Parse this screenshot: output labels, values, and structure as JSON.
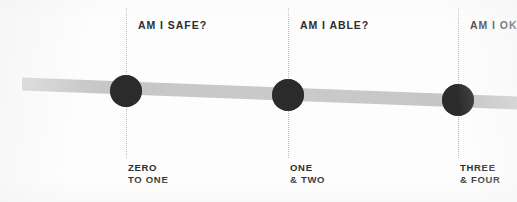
{
  "figure": {
    "type": "timeline-spectrum",
    "background_color": "#fdfdfd",
    "band_color": "#c9c9c9",
    "dot_color": "#2b2b2b",
    "guide_color": "#b9b9b9",
    "text_color": "#2d2d2d"
  },
  "markers": [
    {
      "question": "AM I SAFE?",
      "stage_line1": "ZERO",
      "stage_line2": "TO ONE",
      "x": 126,
      "y": 91,
      "radius": 16
    },
    {
      "question": "AM I ABLE?",
      "stage_line1": "ONE",
      "stage_line2": "& TWO",
      "x": 288,
      "y": 95,
      "radius": 16
    },
    {
      "question": "AM I OK",
      "stage_line1": "THREE",
      "stage_line2": "& FOUR",
      "x": 458,
      "y": 100,
      "radius": 16,
      "clipped": true
    }
  ],
  "band": {
    "left_x": 22,
    "left_y": 84,
    "right_x": 517,
    "right_y": 103,
    "thickness": 13
  }
}
